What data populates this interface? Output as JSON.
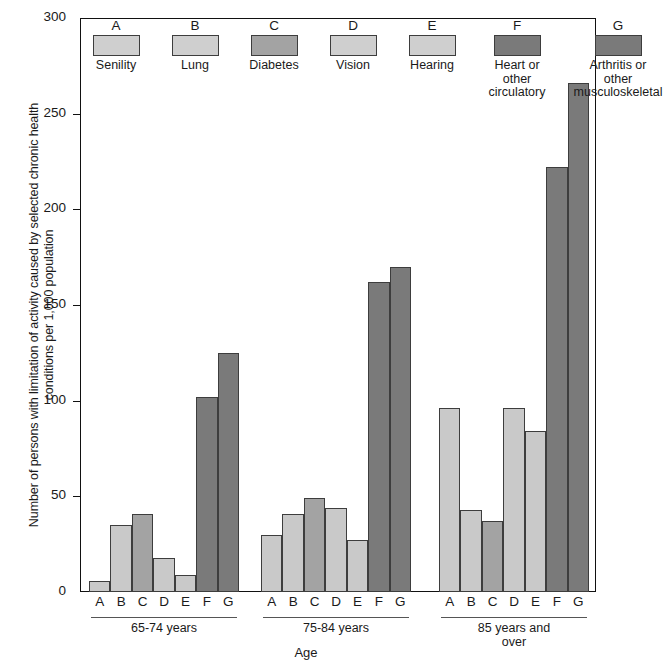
{
  "chart_data": {
    "type": "bar",
    "title": "",
    "xlabel": "Age",
    "ylabel": "Number of persons with limitation of activity caused by selected chronic health conditions per 1,000 population",
    "ylabel_lines": [
      "Number of persons with limitation of activity caused by selected chronic health",
      "conditions per 1,000 population"
    ],
    "ylim": [
      0,
      300
    ],
    "yticks": [
      0,
      50,
      100,
      150,
      200,
      250,
      300
    ],
    "grid": false,
    "legend_position": "inside-top",
    "categories": [
      "A",
      "B",
      "C",
      "D",
      "E",
      "F",
      "G"
    ],
    "groups": [
      "65-74 years",
      "75-84 years",
      "85 years and over"
    ],
    "legend": [
      {
        "key": "A",
        "label": "Senility",
        "label_lines": [
          "Senility"
        ],
        "color": "#cfcfcf",
        "shade": "light"
      },
      {
        "key": "B",
        "label": "Lung",
        "label_lines": [
          "Lung"
        ],
        "color": "#cfcfcf",
        "shade": "light"
      },
      {
        "key": "C",
        "label": "Diabetes",
        "label_lines": [
          "Diabetes"
        ],
        "color": "#a3a3a3",
        "shade": "mid"
      },
      {
        "key": "D",
        "label": "Vision",
        "label_lines": [
          "Vision"
        ],
        "color": "#cfcfcf",
        "shade": "light"
      },
      {
        "key": "E",
        "label": "Hearing",
        "label_lines": [
          "Hearing"
        ],
        "color": "#cfcfcf",
        "shade": "light"
      },
      {
        "key": "F",
        "label": "Heart or other circulatory",
        "label_lines": [
          "Heart or",
          "other",
          "circulatory"
        ],
        "color": "#7a7a7a",
        "shade": "dark"
      },
      {
        "key": "G",
        "label": "Arthritis or other musculoskeletal",
        "label_lines": [
          "Arthritis or",
          "other",
          "musculoskeletal"
        ],
        "color": "#7a7a7a",
        "shade": "dark"
      }
    ],
    "series": [
      {
        "name": "65-74 years",
        "values": [
          6,
          35,
          41,
          18,
          9,
          102,
          125
        ]
      },
      {
        "name": "75-84 years",
        "values": [
          30,
          41,
          49,
          44,
          27,
          162,
          170
        ]
      },
      {
        "name": "85 years and over",
        "values": [
          96,
          43,
          37,
          96,
          84,
          222,
          266
        ]
      }
    ],
    "shades": [
      "light",
      "light",
      "mid",
      "light",
      "light",
      "dark",
      "dark"
    ],
    "colors": {
      "light": "#c9c9c9",
      "mid": "#a3a3a3",
      "dark": "#7a7a7a",
      "axis": "#111111",
      "text": "#1a1a1a"
    }
  }
}
